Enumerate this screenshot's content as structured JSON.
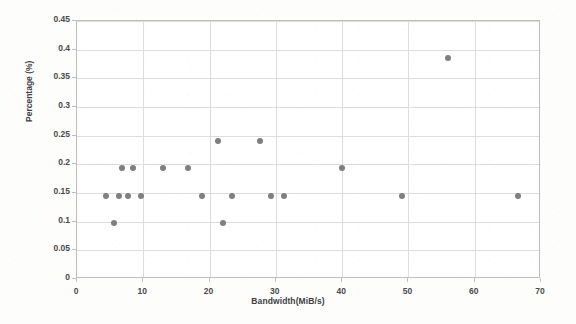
{
  "chart_data": {
    "type": "scatter",
    "title": "",
    "xlabel": "Bandwidth(MiB/s)",
    "ylabel": "Percentage (%)",
    "xlim": [
      0,
      70
    ],
    "ylim": [
      0,
      0.45
    ],
    "xticks": [
      "0",
      "10",
      "20",
      "30",
      "40",
      "50",
      "60",
      "70"
    ],
    "xtick_values": [
      0,
      10,
      20,
      30,
      40,
      50,
      60,
      70
    ],
    "yticks": [
      "0",
      "0.05",
      "0.1",
      "0.15",
      "0.2",
      "0.25",
      "0.3",
      "0.35",
      "0.4",
      "0.45"
    ],
    "ytick_values": [
      0,
      0.05,
      0.1,
      0.15,
      0.2,
      0.25,
      0.3,
      0.35,
      0.4,
      0.45
    ],
    "grid": true,
    "legend": false,
    "marker_color": "#7f7f7f",
    "marker_size": 6,
    "series": [
      {
        "name": "samples",
        "points": [
          {
            "x": 4.3,
            "y": 0.145
          },
          {
            "x": 5.6,
            "y": 0.097
          },
          {
            "x": 6.4,
            "y": 0.145
          },
          {
            "x": 6.8,
            "y": 0.193
          },
          {
            "x": 7.7,
            "y": 0.145
          },
          {
            "x": 8.5,
            "y": 0.193
          },
          {
            "x": 9.6,
            "y": 0.145
          },
          {
            "x": 13.0,
            "y": 0.193
          },
          {
            "x": 16.7,
            "y": 0.193
          },
          {
            "x": 18.9,
            "y": 0.145
          },
          {
            "x": 21.3,
            "y": 0.24
          },
          {
            "x": 22.1,
            "y": 0.097
          },
          {
            "x": 23.4,
            "y": 0.145
          },
          {
            "x": 27.6,
            "y": 0.24
          },
          {
            "x": 29.3,
            "y": 0.145
          },
          {
            "x": 31.3,
            "y": 0.145
          },
          {
            "x": 40.0,
            "y": 0.193
          },
          {
            "x": 49.0,
            "y": 0.145
          },
          {
            "x": 56.0,
            "y": 0.385
          },
          {
            "x": 66.5,
            "y": 0.145
          }
        ]
      }
    ]
  },
  "axes": {
    "x_title": "Bandwidth(MiB/s)",
    "y_title": "Percentage (%)"
  }
}
